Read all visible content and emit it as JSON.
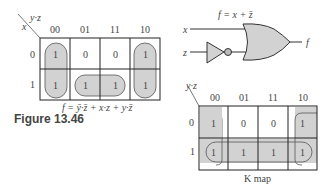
{
  "left_kmap": {
    "corner_row_var": "x",
    "corner_col_var": "y·z",
    "col_headers": [
      "00",
      "01",
      "11",
      "10"
    ],
    "row_headers": [
      "0",
      "1"
    ],
    "cells": [
      [
        "1",
        "0",
        "0",
        "1"
      ],
      [
        "1",
        "1",
        "1",
        "1"
      ]
    ],
    "groups": [
      "column 00 (rows 0-1)",
      "column 10 (rows 0-1)",
      "row 1 columns 01-11"
    ],
    "expression": "f = ȳ·z̄ + x·z + y·z̄"
  },
  "figure_label": "Figure 13.46",
  "circuit": {
    "title": "f = x + z̄",
    "inputs": [
      "x",
      "z"
    ],
    "output": "f",
    "gates": [
      "NOT (inverter on z)",
      "OR"
    ]
  },
  "right_kmap": {
    "corner_col_var": "y·z",
    "col_headers": [
      "00",
      "01",
      "11",
      "10"
    ],
    "row_headers": [
      "0",
      "1"
    ],
    "cells": [
      [
        "1",
        "0",
        "0",
        "1"
      ],
      [
        "1",
        "1",
        "1",
        "1"
      ]
    ],
    "groups": [
      "column 00 + column 10 wrap (z̄)",
      "row 1 all columns (x)"
    ],
    "caption": "K map"
  },
  "colors": {
    "shade": "#d2d2d2",
    "line": "#222222",
    "text": "#444444"
  }
}
